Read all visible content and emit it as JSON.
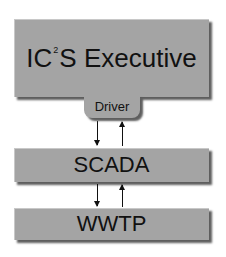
{
  "diagram": {
    "executive": {
      "prefix": "IC",
      "superscript": "2",
      "suffix": "S Executive"
    },
    "driver": {
      "label": "Driver"
    },
    "scada": {
      "label": "SCADA"
    },
    "wwtp": {
      "label": "WWTP"
    },
    "colors": {
      "box_fill": "#a4a4a4",
      "shadow": "#5e5e5e",
      "text": "#111111"
    }
  }
}
